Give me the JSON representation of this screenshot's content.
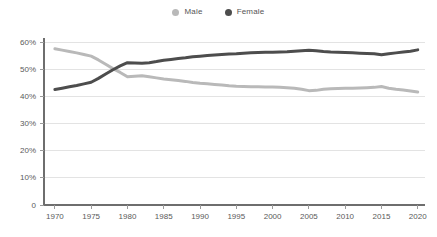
{
  "chart_data": {
    "type": "line",
    "title": "",
    "subtitle": "",
    "xlabel": "",
    "ylabel": "",
    "xlim": [
      1968.5,
      2021
    ],
    "ylim": [
      0,
      62
    ],
    "grid": true,
    "legend_position": "top-center",
    "x_tick_labels": [
      "1970",
      "1975",
      "1980",
      "1985",
      "1990",
      "1995",
      "2000",
      "2005",
      "2010",
      "2015",
      "2020"
    ],
    "x_ticks": [
      1970,
      1975,
      1980,
      1985,
      1990,
      1995,
      2000,
      2005,
      2010,
      2015,
      2020
    ],
    "y_tick_labels": [
      "0",
      "10%",
      "20%",
      "30%",
      "40%",
      "50%",
      "60%"
    ],
    "y_ticks": [
      0,
      10,
      20,
      30,
      40,
      50,
      60
    ],
    "x": [
      1970,
      1971,
      1972,
      1973,
      1974,
      1975,
      1976,
      1977,
      1978,
      1979,
      1980,
      1981,
      1982,
      1983,
      1984,
      1985,
      1986,
      1987,
      1988,
      1989,
      1990,
      1991,
      1992,
      1993,
      1994,
      1995,
      1996,
      1997,
      1998,
      1999,
      2000,
      2001,
      2002,
      2003,
      2004,
      2005,
      2006,
      2007,
      2008,
      2009,
      2010,
      2011,
      2012,
      2013,
      2014,
      2015,
      2016,
      2017,
      2018,
      2019,
      2020
    ],
    "series": [
      {
        "name": "Male",
        "color": "#b9b9b9",
        "values": [
          57.5,
          57.0,
          56.5,
          56.0,
          55.4,
          54.8,
          53.4,
          51.8,
          50.2,
          48.8,
          47.2,
          47.4,
          47.6,
          47.2,
          46.8,
          46.4,
          46.1,
          45.8,
          45.5,
          45.1,
          44.8,
          44.6,
          44.4,
          44.2,
          43.9,
          43.7,
          43.6,
          43.5,
          43.5,
          43.4,
          43.4,
          43.3,
          43.2,
          43.0,
          42.6,
          42.1,
          42.2,
          42.6,
          42.8,
          42.9,
          43.0,
          43.0,
          43.1,
          43.2,
          43.3,
          43.6,
          43.0,
          42.6,
          42.3,
          42.0,
          41.6
        ]
      },
      {
        "name": "Female",
        "color": "#4d4d4d",
        "values": [
          42.5,
          43.0,
          43.5,
          44.0,
          44.6,
          45.2,
          46.6,
          48.2,
          49.8,
          51.2,
          52.4,
          52.3,
          52.2,
          52.4,
          52.8,
          53.3,
          53.6,
          53.9,
          54.2,
          54.6,
          54.8,
          55.0,
          55.2,
          55.4,
          55.6,
          55.7,
          55.9,
          56.0,
          56.1,
          56.2,
          56.2,
          56.3,
          56.4,
          56.6,
          56.8,
          57.0,
          56.8,
          56.5,
          56.3,
          56.2,
          56.1,
          56.0,
          55.9,
          55.8,
          55.7,
          55.3,
          55.7,
          56.0,
          56.3,
          56.6,
          57.1
        ]
      }
    ]
  },
  "legend": {
    "items": [
      {
        "label": "Male",
        "color": "#b9b9b9"
      },
      {
        "label": "Female",
        "color": "#4d4d4d"
      }
    ]
  },
  "colors": {
    "male": "#b9b9b9",
    "female": "#4d4d4d",
    "gridline": "#e3e3e3",
    "axis": "#6e6e6e",
    "tick_label": "#5a5a5a",
    "background": "#ffffff"
  }
}
